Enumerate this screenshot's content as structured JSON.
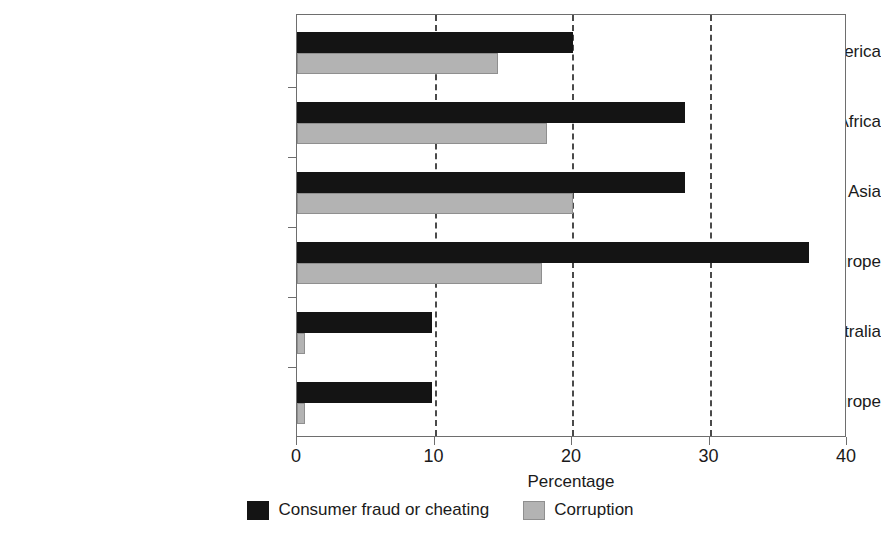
{
  "chart_data": {
    "type": "bar",
    "orientation": "horizontal",
    "title": "",
    "xlabel": "Percentage",
    "ylabel": "",
    "xlim": [
      0,
      40
    ],
    "xticks": [
      0,
      10,
      20,
      30,
      40
    ],
    "xtick_labels": [
      "0",
      "10",
      "20",
      "30",
      "40"
    ],
    "grid": "vertical dashed gridlines at 10, 20, 30",
    "legend_position": "bottom-center",
    "categories": [
      "Latin America",
      "Africa",
      "Asia",
      "Central and Eastern Europe",
      "North America and Australia",
      "Western Europe"
    ],
    "series": [
      {
        "name": "Consumer fraud or cheating",
        "color": "#141414",
        "values": [
          20.1,
          28.2,
          28.2,
          37.2,
          9.8,
          9.8
        ]
      },
      {
        "name": "Corruption",
        "color": "#b3b3b3",
        "values": [
          14.6,
          18.2,
          20.1,
          17.8,
          0.6,
          0.6
        ]
      }
    ]
  },
  "axis": {
    "x_title": "Percentage",
    "tick_labels": [
      "0",
      "10",
      "20",
      "30",
      "40"
    ]
  },
  "legend": {
    "items": [
      {
        "label": "Consumer fraud or cheating",
        "swatch": "black-swatch"
      },
      {
        "label": "Corruption",
        "swatch": "gray-swatch"
      }
    ]
  },
  "category_labels": [
    "Latin America",
    "Africa",
    "Asia",
    "Central and Eastern Europe",
    "North America and Australia",
    "Western Europe"
  ]
}
